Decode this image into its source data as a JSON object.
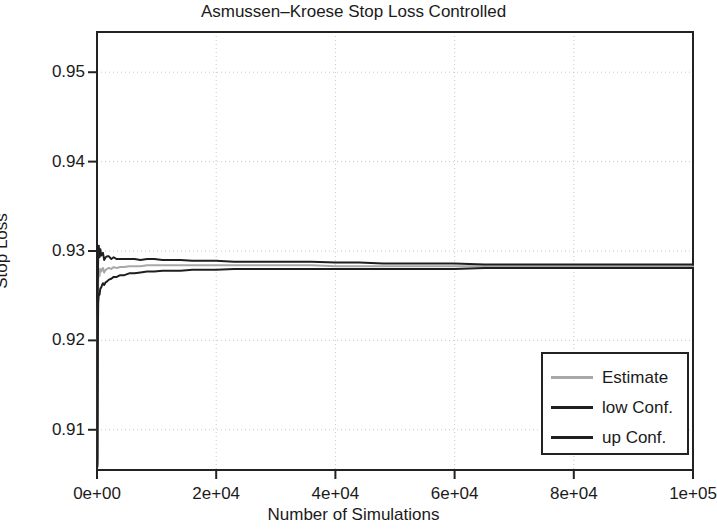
{
  "chart_data": {
    "type": "line",
    "title": "Asmussen–Kroese Stop Loss Controlled",
    "xlabel": "Number of Simulations",
    "ylabel": "Stop Loss",
    "xlim": [
      0,
      100000
    ],
    "ylim": [
      0.9055,
      0.9545
    ],
    "grid": true,
    "grid_style": "dotted",
    "legend_position": "bottom-right",
    "xticks": [
      0,
      20000,
      40000,
      60000,
      80000,
      100000
    ],
    "xticklabels": [
      "0e+00",
      "2e+04",
      "4e+04",
      "6e+04",
      "8e+04",
      "1e+05"
    ],
    "yticks": [
      0.91,
      0.92,
      0.93,
      0.94,
      0.95
    ],
    "yticklabels": [
      "0.91",
      "0.92",
      "0.93",
      "0.94",
      "0.95"
    ],
    "x": [
      60,
      120,
      200,
      300,
      420,
      560,
      700,
      850,
      1000,
      1200,
      1450,
      1700,
      2000,
      2400,
      2800,
      3300,
      3900,
      4600,
      5400,
      6300,
      7300,
      8400,
      9600,
      11000,
      12500,
      14000,
      16000,
      18000,
      20000,
      23000,
      26000,
      29000,
      32000,
      36000,
      40000,
      44000,
      48000,
      52000,
      56000,
      60000,
      65000,
      70000,
      75000,
      80000,
      85000,
      90000,
      95000,
      100000
    ],
    "series": [
      {
        "name": "Estimate",
        "color": "#a8a8a8",
        "linewidth": 2,
        "values": [
          0.9065,
          0.9222,
          0.9268,
          0.9279,
          0.9272,
          0.928,
          0.9277,
          0.9279,
          0.9281,
          0.9276,
          0.9279,
          0.928,
          0.9281,
          0.928,
          0.9282,
          0.9281,
          0.9282,
          0.9282,
          0.9283,
          0.9283,
          0.9283,
          0.9284,
          0.9284,
          0.9284,
          0.9284,
          0.9284,
          0.9284,
          0.9284,
          0.9284,
          0.9284,
          0.9284,
          0.9284,
          0.9284,
          0.9284,
          0.9283,
          0.9283,
          0.9283,
          0.9283,
          0.9283,
          0.9283,
          0.9283,
          0.9283,
          0.9283,
          0.9283,
          0.9283,
          0.9283,
          0.9283,
          0.9283
        ]
      },
      {
        "name": "low Conf.",
        "color": "#1f1f1f",
        "linewidth": 2,
        "values": [
          0.9062,
          0.9193,
          0.9242,
          0.9252,
          0.9251,
          0.9258,
          0.9259,
          0.9262,
          0.9264,
          0.9262,
          0.9265,
          0.9266,
          0.9268,
          0.9269,
          0.9271,
          0.9271,
          0.9273,
          0.9273,
          0.9275,
          0.9275,
          0.9276,
          0.9277,
          0.9277,
          0.9278,
          0.9278,
          0.9278,
          0.9279,
          0.9279,
          0.9279,
          0.928,
          0.928,
          0.928,
          0.928,
          0.928,
          0.928,
          0.928,
          0.928,
          0.928,
          0.928,
          0.928,
          0.9281,
          0.9281,
          0.9281,
          0.9281,
          0.9281,
          0.9281,
          0.9281,
          0.9281
        ]
      },
      {
        "name": "up Conf.",
        "color": "#1f1f1f",
        "linewidth": 2,
        "values": [
          0.9068,
          0.9251,
          0.9294,
          0.9306,
          0.9293,
          0.9302,
          0.9295,
          0.9296,
          0.9298,
          0.929,
          0.9293,
          0.9294,
          0.9294,
          0.9291,
          0.9293,
          0.9291,
          0.9291,
          0.9291,
          0.9291,
          0.9291,
          0.929,
          0.9291,
          0.9291,
          0.929,
          0.929,
          0.929,
          0.9289,
          0.9289,
          0.9289,
          0.9288,
          0.9288,
          0.9288,
          0.9288,
          0.9288,
          0.9287,
          0.9287,
          0.9286,
          0.9286,
          0.9286,
          0.9286,
          0.9285,
          0.9285,
          0.9285,
          0.9285,
          0.9285,
          0.9285,
          0.9285,
          0.9285
        ]
      }
    ],
    "initial_spike": {
      "x": 30,
      "y_min": 0.9058
    }
  },
  "legend": {
    "items": [
      {
        "label": "Estimate",
        "color": "#a8a8a8"
      },
      {
        "label": "low Conf.",
        "color": "#1f1f1f"
      },
      {
        "label": "up Conf.",
        "color": "#1f1f1f"
      }
    ]
  },
  "colors": {
    "frame": "#222222",
    "grid": "#c9c9c9",
    "text": "#1b1b1b",
    "background": "#ffffff"
  }
}
